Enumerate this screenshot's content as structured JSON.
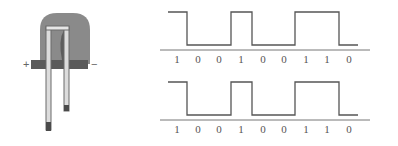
{
  "led": {
    "plus_label": "+",
    "minus_label": "−",
    "body_color": "#8a8a8a",
    "dark_color": "#555555",
    "lead_color": "#e0e0e0",
    "base_color": "#5a5a5a"
  },
  "waveforms": [
    {
      "bits": [
        "1",
        "0",
        "0",
        "1",
        "0",
        "0",
        "1",
        "1",
        "0"
      ]
    },
    {
      "bits": [
        "1",
        "0",
        "0",
        "1",
        "0",
        "0",
        "1",
        "1",
        "0"
      ]
    }
  ],
  "colors": {
    "line": "#555555",
    "baseline": "#777777",
    "text": "#555555"
  }
}
